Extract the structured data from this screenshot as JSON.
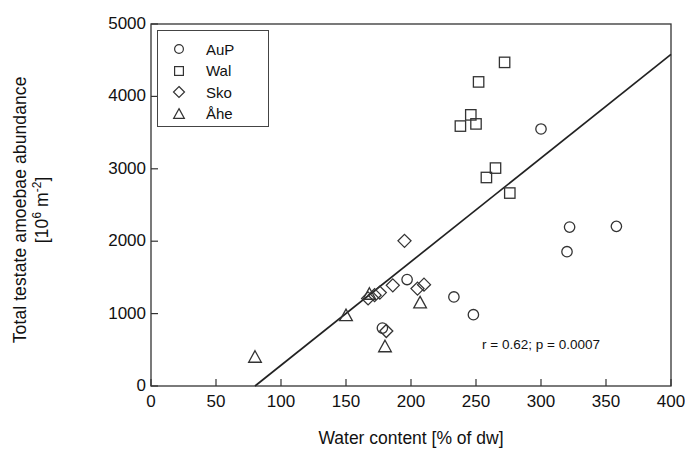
{
  "chart_data": {
    "type": "scatter",
    "title": "",
    "xlabel": "Water content [% of dw]",
    "ylabel_line1": "Total testate amoebae abundance",
    "ylabel_line2_pre": "[10",
    "ylabel_line2_sup1": "6",
    "ylabel_line2_mid": " m",
    "ylabel_line2_sup2": "-2",
    "ylabel_line2_post": "]",
    "xlim": [
      0,
      400
    ],
    "ylim": [
      0,
      5000
    ],
    "xticks": [
      0,
      50,
      100,
      150,
      200,
      250,
      300,
      350,
      400
    ],
    "yticks": [
      0,
      1000,
      2000,
      3000,
      4000,
      5000
    ],
    "xtick_labels": [
      "0",
      "50",
      "100",
      "150",
      "200",
      "250",
      "300",
      "350",
      "400"
    ],
    "ytick_labels": [
      "0",
      "1000",
      "2000",
      "3000",
      "4000",
      "5000"
    ],
    "grid": false,
    "legend_position": "top-left-inside",
    "marker_color": "#333333",
    "line_color": "#222222",
    "annotation": "r = 0.62; p = 0.0007",
    "annotation_x": 300,
    "annotation_y": 560,
    "regression": {
      "x_start": 80,
      "y_start": 0,
      "x_end": 400,
      "y_end": 4580
    },
    "series": [
      {
        "name": "AuP",
        "marker": "circle",
        "points": [
          [
            178,
            800
          ],
          [
            197,
            1470
          ],
          [
            233,
            1230
          ],
          [
            248,
            985
          ],
          [
            300,
            3550
          ],
          [
            320,
            1855
          ],
          [
            322,
            2195
          ],
          [
            358,
            2205
          ]
        ]
      },
      {
        "name": "Wal",
        "marker": "square",
        "points": [
          [
            238,
            3590
          ],
          [
            246,
            3745
          ],
          [
            250,
            3620
          ],
          [
            252,
            4200
          ],
          [
            258,
            2880
          ],
          [
            265,
            3010
          ],
          [
            272,
            4470
          ],
          [
            276,
            2665
          ]
        ]
      },
      {
        "name": "Sko",
        "marker": "diamond",
        "points": [
          [
            167,
            1210
          ],
          [
            172,
            1255
          ],
          [
            176,
            1290
          ],
          [
            181,
            760
          ],
          [
            186,
            1390
          ],
          [
            195,
            2005
          ],
          [
            205,
            1345
          ],
          [
            210,
            1400
          ]
        ]
      },
      {
        "name": "Åhe",
        "marker": "triangle",
        "points": [
          [
            80,
            400
          ],
          [
            150,
            975
          ],
          [
            168,
            1270
          ],
          [
            180,
            545
          ],
          [
            207,
            1150
          ]
        ]
      }
    ]
  },
  "legend": {
    "entries": [
      {
        "label": "AuP",
        "marker": "circle"
      },
      {
        "label": "Wal",
        "marker": "square"
      },
      {
        "label": "Sko",
        "marker": "diamond"
      },
      {
        "label": "Åhe",
        "marker": "triangle"
      }
    ]
  }
}
